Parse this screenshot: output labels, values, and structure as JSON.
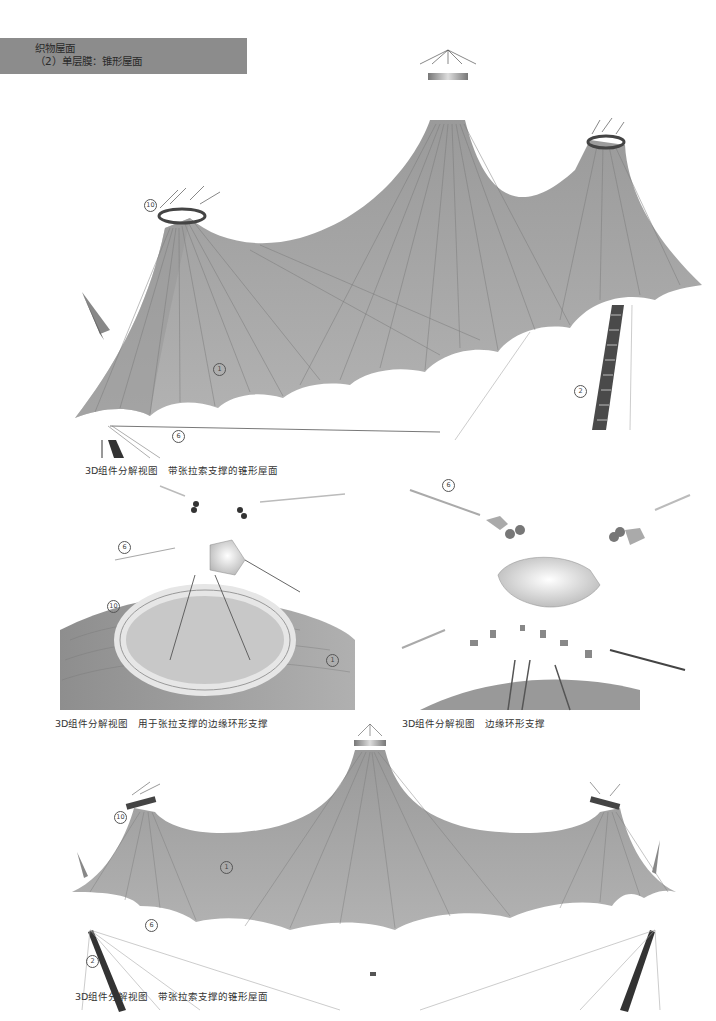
{
  "header": {
    "category": "织物屋面",
    "subtitle": "（2）单层膜：锥形屋面",
    "bar_color": "#8c8c8c"
  },
  "figures": [
    {
      "id": "fig-top",
      "caption_prefix": "3D组件分解视图",
      "caption_text": "带张拉索支撑的锥形屋面",
      "callouts": [
        "10",
        "1",
        "2",
        "6"
      ]
    },
    {
      "id": "fig-middle-left",
      "caption_prefix": "3D组件分解视图",
      "caption_text": "用于张拉支撑的边缘环形支撑",
      "callouts": [
        "6",
        "10",
        "1"
      ]
    },
    {
      "id": "fig-middle-right",
      "caption_prefix": "3D组件分解视图",
      "caption_text": "边缘环形支撑",
      "callouts": [
        "6"
      ]
    },
    {
      "id": "fig-bottom",
      "caption_prefix": "3D组件分解视图",
      "caption_text": "带张拉索支撑的锥形屋面",
      "callouts": [
        "10",
        "1",
        "6",
        "2"
      ]
    }
  ],
  "colors": {
    "membrane": "#a8a8a8",
    "membrane_dark": "#8a8a8a",
    "seam": "#6e6e6e",
    "mast": "#4a4a4a",
    "cable": "#9a9a9a"
  }
}
